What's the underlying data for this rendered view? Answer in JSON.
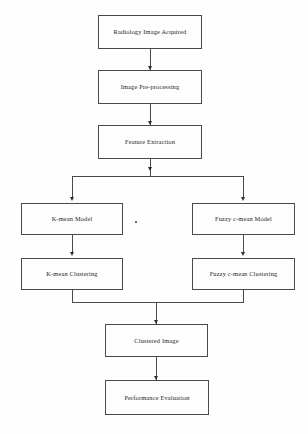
{
  "diagram": {
    "background_color": "#fefefe",
    "box_border_color": "#4a4a4a",
    "box_fill_color": "#fdfdfd",
    "connector_color": "#4a4a4a",
    "text_color": "#1d1d1d",
    "nodes": [
      {
        "id": "radiology_image_acquired",
        "label": "Radiology Image Acquired"
      },
      {
        "id": "image_preprocessing",
        "label": "Image Pre-processing"
      },
      {
        "id": "feature_extraction",
        "label": "Feature Extraction"
      },
      {
        "id": "kmean_model",
        "label": "K-mean Model"
      },
      {
        "id": "fuzzy_cmean_model",
        "label": "Fuzzy c-mean Model"
      },
      {
        "id": "kmean_clustering",
        "label": "K-mean Clustering"
      },
      {
        "id": "fuzzy_cmean_clustering",
        "label": "Fuzzy c-mean Clustering"
      },
      {
        "id": "clustered_image",
        "label": "Clustered Image"
      },
      {
        "id": "performance_evaluation",
        "label": "Performance Evaluation"
      }
    ],
    "edges": [
      {
        "from": "radiology_image_acquired",
        "to": "image_preprocessing"
      },
      {
        "from": "image_preprocessing",
        "to": "feature_extraction"
      },
      {
        "from": "feature_extraction",
        "to": "kmean_model"
      },
      {
        "from": "feature_extraction",
        "to": "fuzzy_cmean_model"
      },
      {
        "from": "kmean_model",
        "to": "kmean_clustering"
      },
      {
        "from": "fuzzy_cmean_model",
        "to": "fuzzy_cmean_clustering"
      },
      {
        "from": "kmean_clustering",
        "to": "clustered_image"
      },
      {
        "from": "fuzzy_cmean_clustering",
        "to": "clustered_image"
      },
      {
        "from": "clustered_image",
        "to": "performance_evaluation"
      }
    ]
  }
}
